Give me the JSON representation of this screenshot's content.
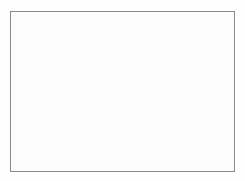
{
  "figure": {
    "kind": "world-distribution-map"
  },
  "frame": {
    "x": 10,
    "y": 11,
    "width": 225,
    "height": 161,
    "border_color": "#8a8a8a",
    "background_color": "#fcfcfc"
  },
  "colors": {
    "page_background": "#ffffff",
    "ocean": "#fbfbfb",
    "land_fill": "#ffffff",
    "land_outline": "#7c7c7c",
    "range_shading": "#9a9a9a",
    "range_outline": "#6d6d6d",
    "latitude_line": "#8f8f8f"
  },
  "graticule": {
    "label": "latitude lines",
    "count": 5,
    "lines": [
      {
        "name": "tropic-of-cancer",
        "y": 53
      },
      {
        "name": "latitude-10n",
        "y": 73
      },
      {
        "name": "equator",
        "y": 93
      },
      {
        "name": "tropic-of-capricorn",
        "y": 113
      },
      {
        "name": "antarctic-circle",
        "y": 153
      }
    ]
  },
  "legend": {
    "shaded_meaning": "distribution range",
    "unshaded_meaning": "outside range"
  },
  "regions": {
    "shaded": [
      "coastal India",
      "Bay of Bengal coast",
      "Myanmar",
      "Thailand",
      "Malay Peninsula",
      "Indochina",
      "southern China",
      "Taiwan",
      "Philippines",
      "Indonesia",
      "Borneo",
      "Sulawesi",
      "New Guinea"
    ],
    "unshaded": [
      "North America",
      "South America",
      "Greenland",
      "Europe",
      "Africa",
      "Northern Asia",
      "Australia",
      "Antarctica"
    ]
  }
}
